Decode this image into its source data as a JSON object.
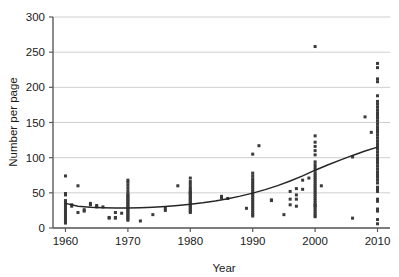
{
  "chart_data": {
    "type": "scatter",
    "title": "",
    "xlabel": "Year",
    "ylabel": "Number per page",
    "xlim": [
      1958,
      2012
    ],
    "ylim": [
      0,
      300
    ],
    "grid": true,
    "legend": null,
    "xticks": [
      1960,
      1970,
      1980,
      1990,
      2000,
      2010
    ],
    "xtick_labels": [
      "1960",
      "1970",
      "1980",
      "1990",
      "2000",
      "2010"
    ],
    "yticks": [
      0,
      50,
      100,
      150,
      200,
      250,
      300
    ],
    "ytick_labels": [
      "0",
      "50",
      "100",
      "150",
      "200",
      "250",
      "300"
    ],
    "point_color": "#3a3a3a",
    "grid_color": "#c9c9c9",
    "axis_color": "#5a5a5a",
    "trend_color": "#262626",
    "points": [
      [
        1960,
        7
      ],
      [
        1960,
        9
      ],
      [
        1960,
        11
      ],
      [
        1960,
        13
      ],
      [
        1960,
        15
      ],
      [
        1960,
        17
      ],
      [
        1960,
        19
      ],
      [
        1960,
        21
      ],
      [
        1960,
        23
      ],
      [
        1960,
        25
      ],
      [
        1960,
        27
      ],
      [
        1960,
        29
      ],
      [
        1960,
        31
      ],
      [
        1960,
        33
      ],
      [
        1960,
        35
      ],
      [
        1960,
        37
      ],
      [
        1960,
        39
      ],
      [
        1960,
        47
      ],
      [
        1960,
        49
      ],
      [
        1960,
        74
      ],
      [
        1961,
        33
      ],
      [
        1961,
        31
      ],
      [
        1962,
        60
      ],
      [
        1962,
        22
      ],
      [
        1963,
        26
      ],
      [
        1963,
        24
      ],
      [
        1964,
        35
      ],
      [
        1964,
        33
      ],
      [
        1965,
        32
      ],
      [
        1965,
        30
      ],
      [
        1966,
        30
      ],
      [
        1967,
        15
      ],
      [
        1967,
        14
      ],
      [
        1968,
        22
      ],
      [
        1968,
        14
      ],
      [
        1968,
        15
      ],
      [
        1969,
        21
      ],
      [
        1970,
        11
      ],
      [
        1970,
        13
      ],
      [
        1970,
        15
      ],
      [
        1970,
        17
      ],
      [
        1970,
        19
      ],
      [
        1970,
        21
      ],
      [
        1970,
        23
      ],
      [
        1970,
        25
      ],
      [
        1970,
        27
      ],
      [
        1970,
        29
      ],
      [
        1970,
        31
      ],
      [
        1970,
        33
      ],
      [
        1970,
        35
      ],
      [
        1970,
        37
      ],
      [
        1970,
        39
      ],
      [
        1970,
        41
      ],
      [
        1970,
        43
      ],
      [
        1970,
        45
      ],
      [
        1970,
        47
      ],
      [
        1970,
        49
      ],
      [
        1970,
        53
      ],
      [
        1970,
        57
      ],
      [
        1970,
        61
      ],
      [
        1970,
        65
      ],
      [
        1970,
        68
      ],
      [
        1972,
        10
      ],
      [
        1974,
        19
      ],
      [
        1976,
        25
      ],
      [
        1976,
        28
      ],
      [
        1978,
        60
      ],
      [
        1980,
        22
      ],
      [
        1980,
        24
      ],
      [
        1980,
        26
      ],
      [
        1980,
        28
      ],
      [
        1980,
        30
      ],
      [
        1980,
        32
      ],
      [
        1980,
        34
      ],
      [
        1980,
        36
      ],
      [
        1980,
        38
      ],
      [
        1980,
        40
      ],
      [
        1980,
        42
      ],
      [
        1980,
        44
      ],
      [
        1980,
        46
      ],
      [
        1980,
        48
      ],
      [
        1980,
        50
      ],
      [
        1980,
        52
      ],
      [
        1980,
        55
      ],
      [
        1980,
        58
      ],
      [
        1980,
        62
      ],
      [
        1980,
        66
      ],
      [
        1980,
        71
      ],
      [
        1980,
        50
      ],
      [
        1985,
        45
      ],
      [
        1985,
        43
      ],
      [
        1986,
        42
      ],
      [
        1989,
        28
      ],
      [
        1990,
        17
      ],
      [
        1990,
        19
      ],
      [
        1990,
        22
      ],
      [
        1990,
        25
      ],
      [
        1990,
        28
      ],
      [
        1990,
        31
      ],
      [
        1990,
        34
      ],
      [
        1990,
        37
      ],
      [
        1990,
        40
      ],
      [
        1990,
        43
      ],
      [
        1990,
        46
      ],
      [
        1990,
        49
      ],
      [
        1990,
        52
      ],
      [
        1990,
        55
      ],
      [
        1990,
        58
      ],
      [
        1990,
        61
      ],
      [
        1990,
        64
      ],
      [
        1990,
        67
      ],
      [
        1990,
        70
      ],
      [
        1990,
        74
      ],
      [
        1990,
        78
      ],
      [
        1990,
        105
      ],
      [
        1991,
        117
      ],
      [
        1993,
        39
      ],
      [
        1993,
        40
      ],
      [
        1995,
        19
      ],
      [
        1996,
        33
      ],
      [
        1996,
        41
      ],
      [
        1996,
        52
      ],
      [
        1997,
        31
      ],
      [
        1997,
        41
      ],
      [
        1997,
        47
      ],
      [
        1997,
        56
      ],
      [
        1998,
        55
      ],
      [
        1998,
        68
      ],
      [
        1999,
        71
      ],
      [
        2000,
        16
      ],
      [
        2000,
        18
      ],
      [
        2000,
        21
      ],
      [
        2000,
        24
      ],
      [
        2000,
        27
      ],
      [
        2000,
        30
      ],
      [
        2000,
        33
      ],
      [
        2000,
        36
      ],
      [
        2000,
        39
      ],
      [
        2000,
        42
      ],
      [
        2000,
        45
      ],
      [
        2000,
        48
      ],
      [
        2000,
        51
      ],
      [
        2000,
        54
      ],
      [
        2000,
        57
      ],
      [
        2000,
        60
      ],
      [
        2000,
        63
      ],
      [
        2000,
        66
      ],
      [
        2000,
        69
      ],
      [
        2000,
        72
      ],
      [
        2000,
        75
      ],
      [
        2000,
        78
      ],
      [
        2000,
        82
      ],
      [
        2000,
        86
      ],
      [
        2000,
        90
      ],
      [
        2000,
        94
      ],
      [
        2000,
        104
      ],
      [
        2000,
        110
      ],
      [
        2000,
        116
      ],
      [
        2000,
        122
      ],
      [
        2000,
        131
      ],
      [
        2000,
        258
      ],
      [
        2000,
        32
      ],
      [
        2001,
        60
      ],
      [
        2006,
        101
      ],
      [
        2006,
        14
      ],
      [
        2008,
        158
      ],
      [
        2009,
        136
      ],
      [
        2010,
        6
      ],
      [
        2010,
        12
      ],
      [
        2010,
        24
      ],
      [
        2010,
        27
      ],
      [
        2010,
        38
      ],
      [
        2010,
        41
      ],
      [
        2010,
        52
      ],
      [
        2010,
        55
      ],
      [
        2010,
        58
      ],
      [
        2010,
        64
      ],
      [
        2010,
        68
      ],
      [
        2010,
        72
      ],
      [
        2010,
        76
      ],
      [
        2010,
        80
      ],
      [
        2010,
        84
      ],
      [
        2010,
        88
      ],
      [
        2010,
        92
      ],
      [
        2010,
        96
      ],
      [
        2010,
        100
      ],
      [
        2010,
        104
      ],
      [
        2010,
        108
      ],
      [
        2010,
        112
      ],
      [
        2010,
        116
      ],
      [
        2010,
        120
      ],
      [
        2010,
        124
      ],
      [
        2010,
        128
      ],
      [
        2010,
        132
      ],
      [
        2010,
        136
      ],
      [
        2010,
        140
      ],
      [
        2010,
        144
      ],
      [
        2010,
        148
      ],
      [
        2010,
        152
      ],
      [
        2010,
        156
      ],
      [
        2010,
        160
      ],
      [
        2010,
        164
      ],
      [
        2010,
        168
      ],
      [
        2010,
        172
      ],
      [
        2010,
        176
      ],
      [
        2010,
        180
      ],
      [
        2010,
        188
      ],
      [
        2010,
        208
      ],
      [
        2010,
        212
      ],
      [
        2010,
        228
      ],
      [
        2010,
        234
      ]
    ],
    "trend_line": [
      [
        1960,
        35
      ],
      [
        1962,
        31
      ],
      [
        1964,
        29.5
      ],
      [
        1966,
        28.7
      ],
      [
        1968,
        28.3
      ],
      [
        1970,
        28.3
      ],
      [
        1972,
        28.8
      ],
      [
        1974,
        29.6
      ],
      [
        1976,
        30.7
      ],
      [
        1978,
        32.1
      ],
      [
        1980,
        33.8
      ],
      [
        1982,
        35.9
      ],
      [
        1984,
        38.5
      ],
      [
        1986,
        41.6
      ],
      [
        1988,
        45.3
      ],
      [
        1990,
        49.6
      ],
      [
        1992,
        54.6
      ],
      [
        1994,
        60.3
      ],
      [
        1996,
        66.8
      ],
      [
        1998,
        74.1
      ],
      [
        2000,
        82.2
      ],
      [
        2002,
        89.5
      ],
      [
        2004,
        96.5
      ],
      [
        2006,
        103.2
      ],
      [
        2008,
        109.4
      ],
      [
        2010,
        115
      ]
    ]
  }
}
